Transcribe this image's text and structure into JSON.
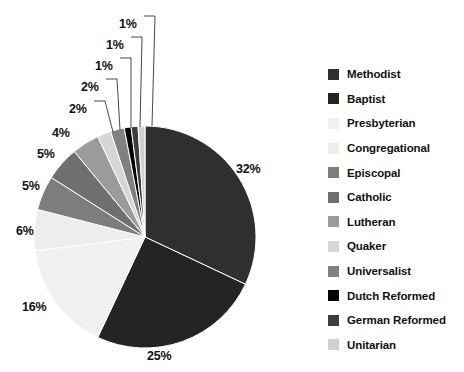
{
  "chart_data": {
    "type": "pie",
    "title": "",
    "subtitle": "",
    "xlabel": "",
    "ylabel": "",
    "legend_position": "right",
    "grid": false,
    "start_angle_deg": 0,
    "direction": "clockwise",
    "categories": [
      "Methodist",
      "Baptist",
      "Presbyterian",
      "Congregational",
      "Episcopal",
      "Catholic",
      "Lutheran",
      "Quaker",
      "Universalist",
      "Dutch Reformed",
      "German Reformed",
      "Unitarian"
    ],
    "values": [
      32,
      25,
      16,
      6,
      5,
      5,
      4,
      2,
      2,
      1,
      1,
      1
    ],
    "value_labels": [
      "32%",
      "25%",
      "16%",
      "6%",
      "5%",
      "5%",
      "4%",
      "2%",
      "2%",
      "1%",
      "1%",
      "1%"
    ],
    "colors": [
      "#2f2f2f",
      "#242424",
      "#f0f0f0",
      "#ededed",
      "#7d7d7d",
      "#6f6f6f",
      "#9b9b9b",
      "#d6d6d6",
      "#808080",
      "#050505",
      "#3d3d3d",
      "#d0d0d0"
    ],
    "slices": [
      {
        "name": "Methodist",
        "value": 32,
        "label": "32%",
        "color": "#2f2f2f",
        "label_mode": "outside"
      },
      {
        "name": "Baptist",
        "value": 25,
        "label": "25%",
        "color": "#242424",
        "label_mode": "outside"
      },
      {
        "name": "Presbyterian",
        "value": 16,
        "label": "16%",
        "color": "#f0f0f0",
        "label_mode": "outside"
      },
      {
        "name": "Congregational",
        "value": 6,
        "label": "6%",
        "color": "#ededed",
        "label_mode": "outside"
      },
      {
        "name": "Episcopal",
        "value": 5,
        "label": "5%",
        "color": "#7d7d7d",
        "label_mode": "outside"
      },
      {
        "name": "Catholic",
        "value": 5,
        "label": "5%",
        "color": "#6f6f6f",
        "label_mode": "outside"
      },
      {
        "name": "Lutheran",
        "value": 4,
        "label": "4%",
        "color": "#9b9b9b",
        "label_mode": "outside"
      },
      {
        "name": "Quaker",
        "value": 2,
        "label": "2%",
        "color": "#d6d6d6",
        "label_mode": "leader"
      },
      {
        "name": "Universalist",
        "value": 2,
        "label": "2%",
        "color": "#808080",
        "label_mode": "leader"
      },
      {
        "name": "Dutch Reformed",
        "value": 1,
        "label": "1%",
        "color": "#050505",
        "label_mode": "leader"
      },
      {
        "name": "German Reformed",
        "value": 1,
        "label": "1%",
        "color": "#3d3d3d",
        "label_mode": "leader"
      },
      {
        "name": "Unitarian",
        "value": 1,
        "label": "1%",
        "color": "#d0d0d0",
        "label_mode": "leader"
      }
    ]
  },
  "pie": {
    "center_x": 145,
    "center_y": 237,
    "radius": 111,
    "percent_labels": [
      {
        "key": "methodist",
        "text": "32%",
        "x": 236,
        "y": 163
      },
      {
        "key": "baptist",
        "text": "25%",
        "x": 147,
        "y": 350
      },
      {
        "key": "presbyterian",
        "text": "16%",
        "x": 22,
        "y": 301
      },
      {
        "key": "congregational",
        "text": "6%",
        "x": 16,
        "y": 225
      },
      {
        "key": "episcopal",
        "text": "5%",
        "x": 22,
        "y": 180
      },
      {
        "key": "catholic",
        "text": "5%",
        "x": 37,
        "y": 148
      },
      {
        "key": "lutheran",
        "text": "4%",
        "x": 52,
        "y": 127
      },
      {
        "key": "quaker",
        "text": "2%",
        "x": 69,
        "y": 103
      },
      {
        "key": "universalist",
        "text": "2%",
        "x": 81,
        "y": 81
      },
      {
        "key": "dutch-reformed",
        "text": "1%",
        "x": 95,
        "y": 60
      },
      {
        "key": "german-reformed",
        "text": "1%",
        "x": 106,
        "y": 39
      },
      {
        "key": "unitarian",
        "text": "1%",
        "x": 119,
        "y": 18
      }
    ],
    "leader_lines": [
      {
        "key": "quaker",
        "x1": 94,
        "y1": 101,
        "x2": 105,
        "y2": 101,
        "x3": 113,
        "y3": 132
      },
      {
        "key": "universalist",
        "x1": 106,
        "y1": 79,
        "x2": 117,
        "y2": 79,
        "x3": 120,
        "y3": 130
      },
      {
        "key": "dutch-reformed",
        "x1": 120,
        "y1": 58,
        "x2": 131,
        "y2": 58,
        "x3": 131,
        "y3": 128
      },
      {
        "key": "german-reformed",
        "x1": 131,
        "y1": 37,
        "x2": 142,
        "y2": 37,
        "x3": 140,
        "y3": 127
      },
      {
        "key": "unitarian",
        "x1": 144,
        "y1": 16,
        "x2": 155,
        "y2": 16,
        "x3": 152,
        "y3": 126
      }
    ]
  },
  "legend": {
    "items": [
      {
        "label": "Methodist",
        "color": "#2f2f2f"
      },
      {
        "label": "Baptist",
        "color": "#242424"
      },
      {
        "label": "Presbyterian",
        "color": "#f0f0f0"
      },
      {
        "label": "Congregational",
        "color": "#ededed"
      },
      {
        "label": "Episcopal",
        "color": "#7d7d7d"
      },
      {
        "label": "Catholic",
        "color": "#6f6f6f"
      },
      {
        "label": "Lutheran",
        "color": "#9b9b9b"
      },
      {
        "label": "Quaker",
        "color": "#d6d6d6"
      },
      {
        "label": "Universalist",
        "color": "#808080"
      },
      {
        "label": "Dutch Reformed",
        "color": "#050505"
      },
      {
        "label": "German Reformed",
        "color": "#3d3d3d"
      },
      {
        "label": "Unitarian",
        "color": "#d0d0d0"
      }
    ]
  }
}
